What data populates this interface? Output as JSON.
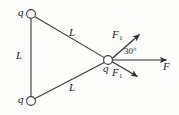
{
  "figure": {
    "width": 179,
    "height": 115,
    "background_color": "#fdfdfc",
    "stroke_color": "#3a3a3a"
  },
  "charges": [
    {
      "id": "q-top",
      "label": "q",
      "x": 31,
      "y": 14
    },
    {
      "id": "q-bottom",
      "label": "q",
      "x": 31,
      "y": 101
    },
    {
      "id": "q-center",
      "label": "q",
      "x": 108,
      "y": 60
    }
  ],
  "sides": [
    {
      "id": "L-left",
      "label": "L"
    },
    {
      "id": "L-upper",
      "label": "L"
    },
    {
      "id": "L-lower",
      "label": "L"
    }
  ],
  "forces": [
    {
      "id": "F1-upper",
      "label": "F",
      "subscript": "1",
      "direction": "up-right"
    },
    {
      "id": "F1-lower",
      "label": "F",
      "subscript": "1",
      "direction": "down-right"
    },
    {
      "id": "F-right",
      "label": "F",
      "subscript": "",
      "direction": "right"
    }
  ],
  "annotations": {
    "angle_label": "30°",
    "angle_value": 30,
    "angle_unit": "degrees"
  }
}
